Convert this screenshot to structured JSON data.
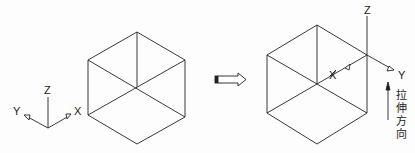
{
  "left_figure": {
    "shape": "isometric cube (hexagon outline with 3 edges to center)",
    "axes": {
      "x_label": "X",
      "y_label": "Y",
      "z_label": "Z"
    }
  },
  "transition": {
    "icon": "hollow-right-arrow-icon"
  },
  "right_figure": {
    "shape": "isometric cube with UCS moved to top-right vertex",
    "axes": {
      "x_label": "X",
      "y_label": "Y",
      "z_label": "Z"
    },
    "direction_note": {
      "chars": [
        "拉",
        "伸",
        "方",
        "向"
      ],
      "meaning": "拉伸方向"
    }
  },
  "colors": {
    "line": "#222222",
    "background": "#fdfdfd"
  }
}
